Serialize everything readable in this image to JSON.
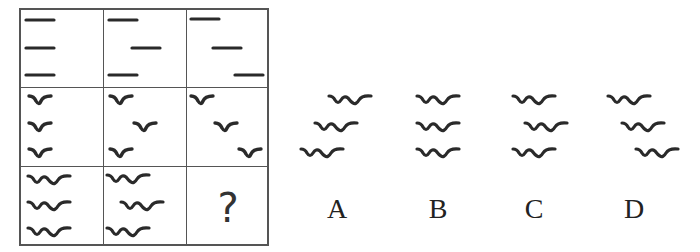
{
  "puzzle": {
    "grid": {
      "rows": 3,
      "cols": 3,
      "row_1": {
        "symbol": "dash",
        "cells": [
          {
            "offsets": [
              0,
              0,
              0
            ]
          },
          {
            "offsets": [
              0,
              1,
              0
            ]
          },
          {
            "offsets": [
              0,
              1,
              2
            ]
          }
        ]
      },
      "row_2": {
        "symbol": "single-wave",
        "cells": [
          {
            "offsets": [
              0,
              0,
              0
            ]
          },
          {
            "offsets": [
              0,
              1,
              0
            ]
          },
          {
            "offsets": [
              0,
              1,
              2
            ]
          }
        ]
      },
      "row_3": {
        "symbol": "double-wave",
        "cells": [
          {
            "offsets": [
              0,
              0,
              0
            ]
          },
          {
            "offsets": [
              0,
              1,
              0
            ]
          },
          {
            "missing": true,
            "placeholder": "?"
          }
        ]
      }
    },
    "question_mark": "?",
    "options": [
      {
        "label": "A",
        "symbol": "double-wave",
        "arrangement": "shift-left-descending"
      },
      {
        "label": "B",
        "symbol": "double-wave",
        "arrangement": "aligned"
      },
      {
        "label": "C",
        "symbol": "double-wave",
        "arrangement": "middle-shifted-right"
      },
      {
        "label": "D",
        "symbol": "double-wave",
        "arrangement": "shift-right-descending"
      }
    ],
    "colors": {
      "ink": "#2a2a2a",
      "grid_line": "#555555",
      "background": "#ffffff"
    }
  }
}
